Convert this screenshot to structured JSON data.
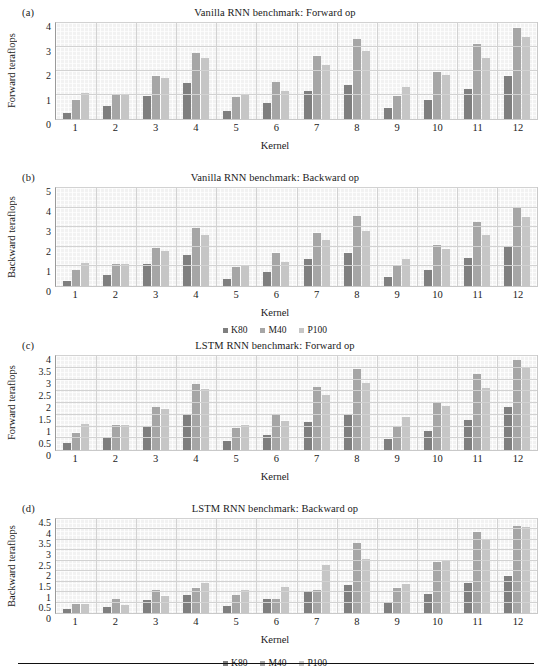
{
  "series_names": [
    "K80",
    "M40",
    "P100"
  ],
  "colors": {
    "k80": "#7f7f7f",
    "m40": "#a6a6a6",
    "p100": "#c6c6c6",
    "plot_bg": "#f2f2f2",
    "grid": "#d2d2d2"
  },
  "legend": {
    "k80": "K80",
    "m40": "M40",
    "p100": "P100"
  },
  "panels": {
    "a": {
      "label": "(a)",
      "title": "Vanilla RNN benchmark: Forward op",
      "ylabel": "Forward teraflops",
      "xlabel": "Kernel"
    },
    "b": {
      "label": "(b)",
      "title": "Vanilla RNN benchmark: Backward op",
      "ylabel": "Backward teraflops",
      "xlabel": "Kernel"
    },
    "c": {
      "label": "(c)",
      "title": "LSTM RNN benchmark: Forward op",
      "ylabel": "Forward teraflops",
      "xlabel": "Kernel"
    },
    "d": {
      "label": "(d)",
      "title": "LSTM RNN benchmark: Backward op",
      "ylabel": "Backward teraflops",
      "xlabel": "Kernel"
    }
  },
  "chart_data": [
    {
      "id": "a",
      "type": "bar",
      "title": "Vanilla RNN benchmark: Forward op",
      "panel_label": "(a)",
      "xlabel": "Kernel",
      "ylabel": "Forward teraflops",
      "categories": [
        "1",
        "2",
        "3",
        "4",
        "5",
        "6",
        "7",
        "8",
        "9",
        "10",
        "11",
        "12"
      ],
      "ylim": [
        0,
        4
      ],
      "yticks": [
        0,
        1,
        2,
        3,
        4
      ],
      "ytick_labels": [
        "0",
        "1",
        "2",
        "3",
        "4"
      ],
      "grid": true,
      "legend_position": "below (shared with panel b)",
      "series": [
        {
          "name": "K80",
          "values": [
            0.25,
            0.55,
            0.97,
            1.52,
            0.33,
            0.65,
            1.15,
            1.43,
            0.44,
            0.78,
            1.25,
            1.78
          ]
        },
        {
          "name": "M40",
          "values": [
            0.78,
            1.04,
            1.78,
            2.76,
            0.9,
            1.54,
            2.62,
            3.35,
            0.97,
            1.97,
            3.13,
            3.78
          ]
        },
        {
          "name": "P100",
          "values": [
            1.08,
            1.04,
            1.7,
            2.56,
            1.02,
            1.17,
            2.26,
            2.82,
            1.35,
            1.84,
            2.56,
            3.42
          ]
        }
      ]
    },
    {
      "id": "b",
      "type": "bar",
      "title": "Vanilla RNN benchmark: Backward op",
      "panel_label": "(b)",
      "xlabel": "Kernel",
      "ylabel": "Backward teraflops",
      "categories": [
        "1",
        "2",
        "3",
        "4",
        "5",
        "6",
        "7",
        "8",
        "9",
        "10",
        "11",
        "12"
      ],
      "ylim": [
        0,
        5
      ],
      "yticks": [
        0,
        1,
        2,
        3,
        4,
        5
      ],
      "ytick_labels": [
        "0",
        "1",
        "2",
        "3",
        "4",
        "5"
      ],
      "grid": true,
      "legend_position": "bottom-center",
      "series": [
        {
          "name": "K80",
          "values": [
            0.24,
            0.56,
            1.1,
            1.58,
            0.34,
            0.7,
            1.38,
            1.68,
            0.44,
            0.8,
            1.45,
            2.02
          ]
        },
        {
          "name": "M40",
          "values": [
            0.8,
            1.1,
            1.92,
            2.96,
            0.98,
            1.66,
            2.7,
            3.58,
            1.08,
            2.08,
            3.28,
            3.96
          ]
        },
        {
          "name": "P100",
          "values": [
            1.16,
            1.1,
            1.78,
            2.62,
            1.08,
            1.22,
            2.36,
            2.8,
            1.4,
            1.88,
            2.62,
            3.5
          ]
        }
      ]
    },
    {
      "id": "c",
      "type": "bar",
      "title": "LSTM RNN benchmark: Forward op",
      "panel_label": "(c)",
      "xlabel": "Kernel",
      "ylabel": "Forward teraflops",
      "categories": [
        "1",
        "2",
        "3",
        "4",
        "5",
        "6",
        "7",
        "8",
        "9",
        "10",
        "11",
        "12"
      ],
      "ylim": [
        0,
        4
      ],
      "yticks": [
        0,
        0.5,
        1,
        1.5,
        2,
        2.5,
        3,
        3.5,
        4
      ],
      "ytick_labels": [
        "0",
        "0.5",
        "1",
        "1.5",
        "2",
        "2.5",
        "3",
        "3.5",
        "4"
      ],
      "grid": true,
      "legend_position": "none (shared)",
      "series": [
        {
          "name": "K80",
          "values": [
            0.28,
            0.56,
            0.98,
            1.54,
            0.38,
            0.66,
            1.2,
            1.48,
            0.45,
            0.8,
            1.28,
            1.85
          ]
        },
        {
          "name": "M40",
          "values": [
            0.74,
            1.06,
            1.82,
            2.8,
            0.92,
            1.55,
            2.7,
            3.44,
            0.98,
            2.02,
            3.22,
            3.82
          ]
        },
        {
          "name": "P100",
          "values": [
            1.12,
            1.06,
            1.74,
            2.6,
            1.05,
            1.24,
            2.32,
            2.86,
            1.4,
            1.86,
            2.62,
            3.52
          ]
        }
      ]
    },
    {
      "id": "d",
      "type": "bar",
      "title": "LSTM RNN benchmark: Backward op",
      "panel_label": "(d)",
      "xlabel": "Kernel",
      "ylabel": "Backward teraflops",
      "categories": [
        "1",
        "2",
        "3",
        "4",
        "5",
        "6",
        "7",
        "8",
        "9",
        "10",
        "11",
        "12"
      ],
      "ylim": [
        0,
        4.5
      ],
      "yticks": [
        0,
        0.5,
        1,
        1.5,
        2,
        2.5,
        3,
        3.5,
        4,
        4.5
      ],
      "ytick_labels": [
        "0",
        "0.5",
        "1",
        "1.5",
        "2",
        "2.5",
        "3",
        "3.5",
        "4",
        "4.5"
      ],
      "grid": true,
      "legend_position": "bottom-center",
      "series": [
        {
          "name": "K80",
          "values": [
            0.18,
            0.28,
            0.62,
            0.88,
            0.35,
            0.68,
            1.05,
            1.32,
            0.55,
            0.92,
            1.42,
            1.75
          ]
        },
        {
          "name": "M40",
          "values": [
            0.45,
            0.68,
            1.08,
            1.22,
            0.85,
            0.68,
            1.1,
            3.35,
            1.18,
            2.45,
            3.88,
            4.18
          ]
        },
        {
          "name": "P100",
          "values": [
            0.45,
            0.4,
            0.82,
            1.45,
            1.08,
            1.25,
            2.28,
            2.58,
            1.38,
            2.52,
            3.48,
            4.12
          ]
        }
      ]
    }
  ]
}
